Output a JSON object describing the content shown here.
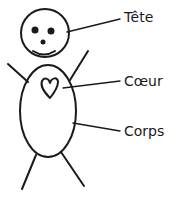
{
  "diagram": {
    "type": "labeled-stick-figure",
    "labels": [
      {
        "id": "head",
        "text": "Tête"
      },
      {
        "id": "heart",
        "text": "Cœur"
      },
      {
        "id": "body",
        "text": "Corps"
      }
    ],
    "colors": {
      "ink": "#1a1a1a",
      "background": "#ffffff"
    }
  }
}
